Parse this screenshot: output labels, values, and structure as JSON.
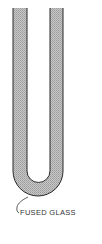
{
  "diagram": {
    "label": "FUSED GLASS",
    "colors": {
      "wall_fill": "#bdbdbd",
      "wall_outline": "#2a2a2a",
      "background": "#ffffff",
      "text": "#333333"
    },
    "elements": [
      {
        "type": "u-tube",
        "description": "Cross-section of a U-shaped glass tube with shaded walls"
      },
      {
        "type": "leader-line",
        "description": "Curved pointer from tube bottom to label"
      },
      {
        "type": "label",
        "text": "FUSED GLASS"
      }
    ]
  }
}
